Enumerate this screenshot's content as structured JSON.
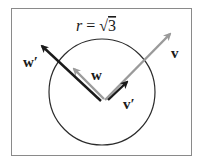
{
  "title": "r = √3",
  "title_parts": {
    "var": "r",
    "eq": " = ",
    "radical": "√",
    "value": "3"
  },
  "colors": {
    "frame": "#8a8a8a",
    "circle": "#2b2b2b",
    "black_vector": "#1a1a1a",
    "gray_vector": "#9a9a9a",
    "label": "#1a1a1a"
  },
  "vectors": [
    {
      "name": "w_prime",
      "label": "w′",
      "color": "black"
    },
    {
      "name": "w",
      "label": "w",
      "color": "gray"
    },
    {
      "name": "v",
      "label": "v",
      "color": "gray"
    },
    {
      "name": "v_prime",
      "label": "v′",
      "color": "black"
    }
  ],
  "circle": {
    "radius_label": "√3"
  }
}
